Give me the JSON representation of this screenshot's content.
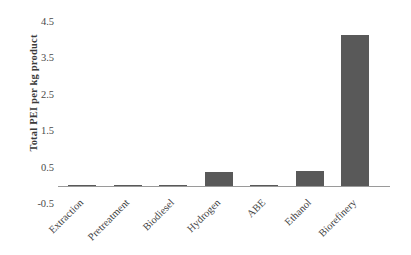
{
  "chart_data": {
    "type": "bar",
    "title": "",
    "subtitle": "",
    "xlabel": "",
    "ylabel": "Total PEI per kg product",
    "categories": [
      "Extraction",
      "Pretreatment",
      "Biodiesel",
      "Hydrogen",
      "ABE",
      "Ethanol",
      "Biorefinery"
    ],
    "values": [
      0.005,
      0.01,
      0.01,
      0.39,
      0.03,
      0.41,
      4.15
    ],
    "series": [
      {
        "name": "Total PEI per kg product",
        "values": [
          0.005,
          0.01,
          0.01,
          0.39,
          0.03,
          0.41,
          4.15
        ]
      }
    ],
    "ylim": [
      -0.5,
      4.5
    ],
    "ytick_labels": [
      "4.5",
      "3.5",
      "2.5",
      "1.5",
      "0.5",
      "-0.5"
    ],
    "ytick_values": [
      4.5,
      3.5,
      2.5,
      1.5,
      0.5,
      -0.5
    ],
    "grid": false,
    "legend": false,
    "legend_position": "none",
    "bar_color": "#595959",
    "axis_color": "#9a9a9a",
    "text_color": "#3f3f3f",
    "background_color": "#ffffff"
  },
  "axis": {
    "y_title": "Total PEI per kg product"
  }
}
